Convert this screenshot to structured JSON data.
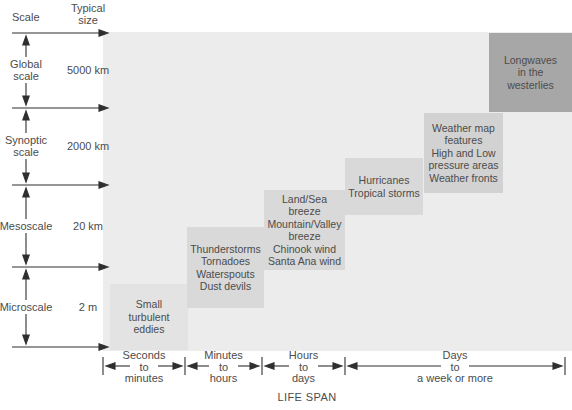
{
  "colors": {
    "plot_background": "#ececec",
    "box_small_eddies": "#e3e3e3",
    "box_medium_gray": "#d9d9d9",
    "box_weather_map": "#d2d2d2",
    "box_longwaves": "#a7a7a7",
    "text": "#4c4c4c",
    "line": "#2f2f2f"
  },
  "headers": {
    "scale": "Scale",
    "typical_size": "Typical\nsize"
  },
  "scale_axis": {
    "bands": [
      {
        "id": "global",
        "label": "Global\nscale",
        "typical_size": "5000 km"
      },
      {
        "id": "synoptic",
        "label": "Synoptic\nscale",
        "typical_size": "2000 km"
      },
      {
        "id": "meso",
        "label": "Mesoscale",
        "typical_size": "20 km"
      },
      {
        "id": "micro",
        "label": "Microscale",
        "typical_size": "2 m"
      }
    ]
  },
  "plot": {
    "boxes": [
      {
        "id": "small-turbulent-eddies",
        "text": "Small\nturbulent\neddies",
        "color": "#e3e3e3"
      },
      {
        "id": "thunderstorms",
        "text": "Thunderstorms\nTornadoes\nWaterspouts\nDust devils",
        "color": "#d9d9d9"
      },
      {
        "id": "local-winds",
        "text": "Land/Sea\nbreeze\nMountain/Valley\nbreeze\nChinook wind\nSanta Ana wind",
        "color": "#d9d9d9"
      },
      {
        "id": "hurricanes",
        "text": "Hurricanes\nTropical storms",
        "color": "#d9d9d9"
      },
      {
        "id": "weather-map-features",
        "text": "Weather map\nfeatures\nHigh and Low\npressure areas\nWeather fronts",
        "color": "#d2d2d2"
      },
      {
        "id": "longwaves",
        "text": "Longwaves\nin the\nwesterlies",
        "color": "#a7a7a7"
      }
    ]
  },
  "time_axis": {
    "label": "LIFE SPAN",
    "intervals": [
      {
        "text": "Seconds\nto\nminutes"
      },
      {
        "text": "Minutes\nto\nhours"
      },
      {
        "text": "Hours\nto\ndays"
      },
      {
        "text": "Days\nto\na week or more"
      }
    ]
  }
}
